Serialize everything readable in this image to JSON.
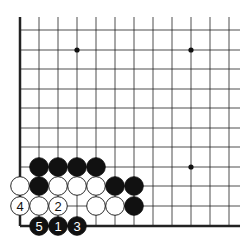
{
  "board": {
    "cols_x": [
      20,
      39,
      58,
      77,
      96,
      115,
      134,
      153,
      172,
      191,
      210,
      229
    ],
    "rows_y": [
      17,
      30,
      50,
      69,
      89,
      108,
      128,
      147,
      167,
      186,
      206,
      226
    ],
    "left_edge_x": 20,
    "bottom_edge_y": 226,
    "right_x": 240,
    "top_y": 17,
    "star_points": [
      [
        77,
        50
      ],
      [
        191,
        50
      ],
      [
        191,
        167
      ]
    ],
    "stones": [
      {
        "x": 39,
        "y": 167,
        "color": "black",
        "label": ""
      },
      {
        "x": 58,
        "y": 167,
        "color": "black",
        "label": ""
      },
      {
        "x": 77,
        "y": 167,
        "color": "black",
        "label": ""
      },
      {
        "x": 96,
        "y": 167,
        "color": "black",
        "label": ""
      },
      {
        "x": 20,
        "y": 186,
        "color": "white",
        "label": ""
      },
      {
        "x": 39,
        "y": 186,
        "color": "black",
        "label": ""
      },
      {
        "x": 58,
        "y": 186,
        "color": "white",
        "label": ""
      },
      {
        "x": 77,
        "y": 186,
        "color": "white",
        "label": ""
      },
      {
        "x": 96,
        "y": 186,
        "color": "white",
        "label": ""
      },
      {
        "x": 115,
        "y": 186,
        "color": "black",
        "label": ""
      },
      {
        "x": 134,
        "y": 186,
        "color": "black",
        "label": ""
      },
      {
        "x": 20,
        "y": 206,
        "color": "white",
        "label": "4"
      },
      {
        "x": 39,
        "y": 206,
        "color": "white",
        "label": ""
      },
      {
        "x": 58,
        "y": 206,
        "color": "white",
        "label": "2"
      },
      {
        "x": 96,
        "y": 206,
        "color": "white",
        "label": ""
      },
      {
        "x": 115,
        "y": 206,
        "color": "white",
        "label": ""
      },
      {
        "x": 134,
        "y": 206,
        "color": "black",
        "label": ""
      },
      {
        "x": 39,
        "y": 226,
        "color": "black",
        "label": "5"
      },
      {
        "x": 58,
        "y": 226,
        "color": "black",
        "label": "1"
      },
      {
        "x": 77,
        "y": 226,
        "color": "black",
        "label": "3"
      }
    ]
  }
}
